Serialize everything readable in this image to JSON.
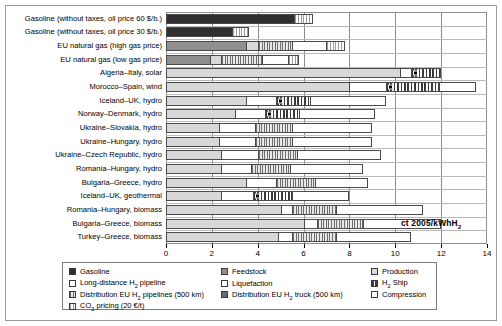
{
  "chart_data": {
    "type": "bar",
    "orientation": "horizontal",
    "stacked": true,
    "title": "",
    "xlabel": "ct 2005/kWhH2",
    "ylabel": "",
    "xlim": [
      0,
      14
    ],
    "xticks": [
      0,
      2,
      4,
      6,
      8,
      10,
      12,
      14
    ],
    "grid": true,
    "legend_position": "bottom",
    "categories": [
      "Gasoline (without taxes, oil price 60 $/b.)",
      "Gasoline (without taxes, oil price 30 $/b.)",
      "EU natural gas (high gas price)",
      "EU natural gas (low gas price)",
      "Algeria–Italy, solar",
      "Morocco–Spain, wind",
      "Iceland–UK, hydro",
      "Norway–Denmark, hydro",
      "Ukraine–Slovakia, hydro",
      "Ukraine–Hungary, hydro",
      "Ukraine–Czech Republic, hydro",
      "Romania–Hungary, hydro",
      "Bulgaria–Greece, hydro",
      "Iceland–UK, geothermal",
      "Romania–Hungary, biomass",
      "Bulgaria–Greece, biomass",
      "Turkey–Greece, biomass"
    ],
    "series": [
      {
        "name": "Gasoline",
        "key": "gasoline",
        "values": [
          5.6,
          2.9,
          0,
          0,
          0,
          0,
          0,
          0,
          0,
          0,
          0,
          0,
          0,
          0,
          0,
          0,
          0
        ]
      },
      {
        "name": "Feedstock",
        "key": "feedstock",
        "values": [
          0,
          0,
          3.5,
          1.9,
          0,
          0,
          0,
          0,
          0,
          0,
          0,
          0,
          0,
          0,
          0,
          0,
          0
        ]
      },
      {
        "name": "Production",
        "key": "production",
        "values": [
          0,
          0,
          0.5,
          0.5,
          10.2,
          8.0,
          3.5,
          3.0,
          2.3,
          2.3,
          2.4,
          2.4,
          3.5,
          2.4,
          5.0,
          6.0,
          4.9
        ]
      },
      {
        "name": "Long-distance H2 pipeline",
        "key": "longpipe",
        "values": [
          0,
          0,
          0,
          0,
          0,
          0,
          0,
          0,
          0,
          0,
          0,
          0,
          0,
          0,
          0,
          0,
          0
        ]
      },
      {
        "name": "Liquefaction",
        "key": "liquefaction",
        "values": [
          0,
          0,
          0,
          0,
          0.5,
          1.6,
          1.3,
          1.3,
          1.6,
          1.6,
          1.6,
          1.3,
          1.3,
          1.4,
          0.5,
          0.6,
          0.6
        ]
      },
      {
        "name": "H2 Ship",
        "key": "ship",
        "values": [
          0,
          0,
          0,
          0,
          1.3,
          2.3,
          1.5,
          1.5,
          0,
          0,
          0,
          0,
          0,
          1.7,
          0,
          0,
          0
        ]
      },
      {
        "name": "Distribution EU H2 pipelines (500 km)",
        "key": "distpipe",
        "values": [
          0,
          0,
          1.5,
          1.8,
          0,
          0,
          0,
          0,
          1.6,
          1.6,
          1.7,
          1.7,
          1.7,
          0,
          1.9,
          2.0,
          1.9
        ]
      },
      {
        "name": "Distribution EU H2 truck (500 km)",
        "key": "disttruck",
        "values": [
          0,
          0,
          0,
          0,
          0,
          0,
          0,
          0,
          0,
          0,
          0,
          0,
          0,
          0,
          0,
          0,
          0
        ]
      },
      {
        "name": "Compression",
        "key": "compression",
        "values": [
          0,
          0,
          1.5,
          1.1,
          0,
          1.6,
          3.3,
          3.3,
          3.5,
          3.5,
          3.7,
          3.2,
          2.3,
          2.5,
          3.8,
          3.4,
          3.3
        ]
      },
      {
        "name": "CO2 pricing (20 €/t)",
        "key": "co2",
        "values": [
          0.8,
          0.7,
          0.8,
          0.5,
          0,
          0,
          0,
          0,
          0,
          0,
          0,
          0,
          0,
          0,
          0,
          0,
          0
        ]
      }
    ],
    "totals": [
      6.4,
      3.6,
      7.8,
      5.8,
      12.0,
      13.5,
      9.6,
      9.1,
      9.0,
      9.0,
      9.4,
      8.6,
      8.8,
      8.0,
      11.2,
      12.0,
      10.7
    ]
  },
  "legend": {
    "columns": [
      [
        {
          "label": "Gasoline",
          "key": "gasoline"
        },
        {
          "label": "Long-distance H2 pipeline",
          "key": "longpipe",
          "sub": "2"
        },
        {
          "label": "Distribution EU H2 pipelines (500 km)",
          "key": "distpipe",
          "sub": "2"
        },
        {
          "label": "CO2 pricing (20 €/t)",
          "key": "co2",
          "sub": "2"
        }
      ],
      [
        {
          "label": "Feedstock",
          "key": "feedstock"
        },
        {
          "label": "Liquefaction",
          "key": "liquefaction"
        },
        {
          "label": "Distribution EU H2 truck (500 km)",
          "key": "disttruck",
          "sub": "2"
        }
      ],
      [
        {
          "label": "Production",
          "key": "production"
        },
        {
          "label": "H2 Ship",
          "key": "ship",
          "sub": "2"
        },
        {
          "label": "Compression",
          "key": "compression"
        }
      ]
    ]
  },
  "colors": {
    "gasoline": "#2f2f2f",
    "feedstock": "#8f8f8f",
    "production": "#d8d8d8",
    "longpipe": "#ffffff",
    "liquefaction": "#ffffff",
    "ship": "#3a3a3a",
    "distpipe": "#d0d0d0",
    "disttruck": "#6a6a6a",
    "compression": "#ffffff",
    "co2": "#ffffff",
    "frame": "#8d8d8d",
    "grid": "#8d8d8d"
  },
  "axis_unit": {
    "text": "ct 2005/kWhH",
    "sub": "2"
  }
}
